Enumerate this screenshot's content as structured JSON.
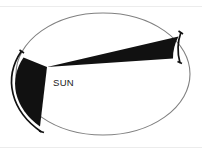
{
  "figure": {
    "background_color": "#ffffff",
    "width": 202,
    "height": 153
  },
  "labels": {
    "sun": "SUN"
  },
  "colors": {
    "orbit_stroke": "#808080",
    "sector_fill": "#111111",
    "arc_marker": "#111111",
    "label_text": "#1a1a1a",
    "frame": "#e3e3e3",
    "background": "#ffffff"
  },
  "orbit": {
    "shape": "ellipse",
    "center_x": 103,
    "center_y": 74,
    "radius_x": 87,
    "radius_y": 61,
    "stroke_width": 1.1,
    "fill": "#ffffff"
  },
  "focus": {
    "name": "sun-focus",
    "x": 47,
    "y": 67,
    "label": "SUN",
    "label_x": 53,
    "label_y": 85
  },
  "sectors": [
    {
      "name": "perihelion-sector",
      "description": "wide short swept area near the Sun",
      "fill": "#111111",
      "path": "M 47,67 L 24,58 A 87,61 0 0 0 40,126 Z"
    },
    {
      "name": "aphelion-sector",
      "description": "narrow long swept area far from the Sun",
      "fill": "#111111",
      "path": "M 47,67 L 178,37 A 87,61 0 0 0 172,58 Z"
    }
  ],
  "arc_markers": [
    {
      "name": "perihelion-arc-marker",
      "path": "M 22,52 A 94,68 0 0 0 41,131",
      "stroke_width": 1.6
    },
    {
      "name": "aphelion-arc-marker",
      "path": "M 181,33 A 94,68 0 0 0 179,62",
      "stroke_width": 1.6
    }
  ],
  "frame": {
    "top_line_visible": true,
    "bottom_line_visible": true
  },
  "annotations": {
    "meaning": "Equal areas swept in equal times"
  }
}
